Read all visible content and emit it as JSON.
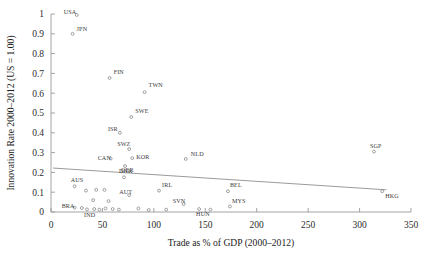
{
  "chart_data": {
    "type": "scatter",
    "title": "",
    "xlabel": "Trade as % of GDP (2000–2012)",
    "ylabel": "Innovation Rate 2000–2012 (US = 1.00)",
    "xlim": [
      0,
      350
    ],
    "ylim": [
      0,
      1
    ],
    "xticks": [
      0,
      50,
      100,
      150,
      200,
      250,
      300,
      350
    ],
    "yticks": [
      0,
      0.1,
      0.2,
      0.3,
      0.4,
      0.5,
      0.6,
      0.7,
      0.8,
      0.9,
      1
    ],
    "xtick_labels": [
      "0",
      "50",
      "100",
      "150",
      "200",
      "250",
      "300",
      "350"
    ],
    "ytick_labels": [
      "0",
      "0.1",
      "0.2",
      "0.3",
      "0.4",
      "0.5",
      "0.6",
      "0.7",
      "0.8",
      "0.9",
      "1"
    ],
    "grid": false,
    "legend": null,
    "marker_color": "#8a8a8a",
    "trend_color": "#8e8e8e",
    "trendline": {
      "x_start": 2,
      "y_start": 0.222,
      "x_end": 326,
      "y_end": 0.112
    },
    "points": [
      {
        "label": "USA",
        "x": 25,
        "y": 0.995,
        "label_dx": -13,
        "label_dy": -1
      },
      {
        "label": "JPN",
        "x": 21,
        "y": 0.9,
        "label_dx": 4,
        "label_dy": -3
      },
      {
        "label": "FIN",
        "x": 57,
        "y": 0.677,
        "label_dx": 4,
        "label_dy": -4
      },
      {
        "label": "TWN",
        "x": 91,
        "y": 0.605,
        "label_dx": 4,
        "label_dy": -5
      },
      {
        "label": "SWE",
        "x": 78,
        "y": 0.48,
        "label_dx": 4,
        "label_dy": -4
      },
      {
        "label": "ISR",
        "x": 67,
        "y": 0.4,
        "label_dx": -12,
        "label_dy": -2
      },
      {
        "label": "SWZ",
        "x": 76,
        "y": 0.318,
        "label_dx": -12,
        "label_dy": -3
      },
      {
        "label": "KOR",
        "x": 79,
        "y": 0.272,
        "label_dx": 4,
        "label_dy": 1
      },
      {
        "label": "CAN",
        "x": 58,
        "y": 0.27,
        "label_dx": -13,
        "label_dy": 1
      },
      {
        "label": "GER",
        "x": 72,
        "y": 0.232,
        "label_dx": -4,
        "label_dy": 6
      },
      {
        "label": "NLD",
        "x": 131,
        "y": 0.268,
        "label_dx": 5,
        "label_dy": -3
      },
      {
        "label": "SGP",
        "x": 314,
        "y": 0.305,
        "label_dx": -4,
        "label_dy": -4
      },
      {
        "label": "DNK",
        "x": 71,
        "y": 0.175,
        "label_dx": -5,
        "label_dy": -4
      },
      {
        "label": "AUS",
        "x": 23,
        "y": 0.13,
        "label_dx": -4,
        "label_dy": -4
      },
      {
        "label": "AUT",
        "x": 76,
        "y": 0.085,
        "label_dx": -10,
        "label_dy": -1
      },
      {
        "label": "IRL",
        "x": 105,
        "y": 0.108,
        "label_dx": 3,
        "label_dy": -4
      },
      {
        "label": "BEL",
        "x": 172,
        "y": 0.105,
        "label_dx": 2,
        "label_dy": -4
      },
      {
        "label": "SVN",
        "x": 129,
        "y": 0.04,
        "label_dx": -11,
        "label_dy": -1
      },
      {
        "label": "MYS",
        "x": 174,
        "y": 0.028,
        "label_dx": 2,
        "label_dy": -3
      },
      {
        "label": "HUN",
        "x": 144,
        "y": 0.015,
        "label_dx": -3,
        "label_dy": 7
      },
      {
        "label": "HKG",
        "x": 322,
        "y": 0.105,
        "label_dx": 3,
        "label_dy": 7
      },
      {
        "label": "BRA",
        "x": 23,
        "y": 0.022,
        "label_dx": -13,
        "label_dy": 0
      },
      {
        "label": "IND",
        "x": 35,
        "y": 0.013,
        "label_dx": -3,
        "label_dy": 8
      },
      {
        "label": "",
        "x": 34,
        "y": 0.108,
        "label_dx": 0,
        "label_dy": 0
      },
      {
        "label": "",
        "x": 44,
        "y": 0.112,
        "label_dx": 0,
        "label_dy": 0
      },
      {
        "label": "",
        "x": 52,
        "y": 0.112,
        "label_dx": 0,
        "label_dy": 0
      },
      {
        "label": "",
        "x": 41,
        "y": 0.06,
        "label_dx": 0,
        "label_dy": 0
      },
      {
        "label": "",
        "x": 56,
        "y": 0.055,
        "label_dx": 0,
        "label_dy": 0
      },
      {
        "label": "",
        "x": 30,
        "y": 0.02,
        "label_dx": 0,
        "label_dy": 0
      },
      {
        "label": "",
        "x": 42,
        "y": 0.015,
        "label_dx": 0,
        "label_dy": 0
      },
      {
        "label": "",
        "x": 47,
        "y": 0.012,
        "label_dx": 0,
        "label_dy": 0
      },
      {
        "label": "",
        "x": 53,
        "y": 0.018,
        "label_dx": 0,
        "label_dy": 0
      },
      {
        "label": "",
        "x": 60,
        "y": 0.015,
        "label_dx": 0,
        "label_dy": 0
      },
      {
        "label": "",
        "x": 66,
        "y": 0.012,
        "label_dx": 0,
        "label_dy": 0
      },
      {
        "label": "",
        "x": 85,
        "y": 0.018,
        "label_dx": 0,
        "label_dy": 0
      },
      {
        "label": "",
        "x": 95,
        "y": 0.01,
        "label_dx": 0,
        "label_dy": 0
      },
      {
        "label": "",
        "x": 112,
        "y": 0.012,
        "label_dx": 0,
        "label_dy": 0
      },
      {
        "label": "",
        "x": 155,
        "y": 0.012,
        "label_dx": 0,
        "label_dy": 0
      }
    ]
  }
}
